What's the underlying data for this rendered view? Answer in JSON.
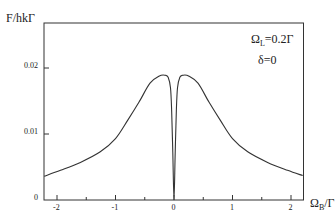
{
  "chart_data": {
    "type": "line",
    "title": "",
    "ylabel": "F/hkΓ",
    "xlabel_main": "Ω",
    "xlabel_sub": "B",
    "xlabel_tail": "/Γ",
    "annotations": [
      {
        "main": "Ω",
        "sub": "L",
        "tail": "=0.2Γ"
      },
      {
        "text": "δ=0"
      }
    ],
    "xlim": [
      -2.22,
      2.2
    ],
    "ylim": [
      0,
      0.0235
    ],
    "x_ticks": [
      "-2",
      "-1",
      "0",
      "1",
      "2"
    ],
    "x_tick_values": [
      -2,
      -1,
      0,
      1,
      2
    ],
    "x_minor_ticks": [
      -1.5,
      -0.5,
      0.5,
      1.5
    ],
    "y_ticks": [
      "0",
      "0.01",
      "0.02"
    ],
    "y_tick_values": [
      0,
      0.01,
      0.02
    ],
    "grid": false,
    "legend": "none",
    "series": [
      {
        "name": "F(ΩB)",
        "x": [
          -2.22,
          -1.94,
          -1.6,
          -1.26,
          -1.0,
          -0.79,
          -0.6,
          -0.41,
          -0.25,
          -0.15,
          -0.1,
          -0.06,
          -0.04,
          -0.02,
          0.0,
          0.02,
          0.04,
          0.06,
          0.1,
          0.15,
          0.25,
          0.41,
          0.6,
          0.79,
          1.0,
          1.26,
          1.6,
          1.94,
          2.2
        ],
        "values": [
          0.0036,
          0.0045,
          0.0057,
          0.0073,
          0.0093,
          0.0121,
          0.0148,
          0.0177,
          0.0188,
          0.0189,
          0.0186,
          0.017,
          0.0135,
          0.007,
          0.0,
          0.007,
          0.0135,
          0.017,
          0.0186,
          0.0189,
          0.0188,
          0.0177,
          0.0148,
          0.0121,
          0.0093,
          0.0073,
          0.0057,
          0.0045,
          0.0037
        ]
      }
    ]
  }
}
